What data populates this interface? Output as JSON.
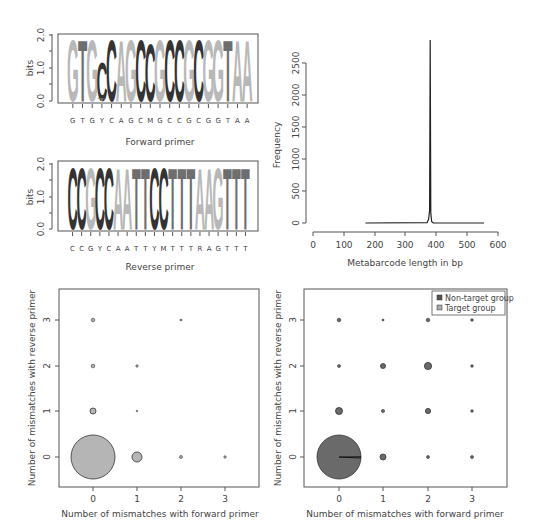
{
  "colors": {
    "logo_C": "#333333",
    "logo_G": "#b8b8b8",
    "logo_A": "#b8b8b8",
    "logo_T": "#6e6e6e",
    "target_fill": "#b5b5b5",
    "nontarget_fill": "#6a6a6a",
    "axis": "#555555"
  },
  "forward_logo": {
    "ylabel": "bits",
    "yticks": [
      "0.0",
      "1.0",
      "2.0"
    ],
    "xlabel": "Forward primer",
    "consensus": [
      "G",
      "T",
      "G",
      "Y",
      "C",
      "A",
      "G",
      "C",
      "M",
      "G",
      "C",
      "C",
      "G",
      "C",
      "G",
      "G",
      "T",
      "A",
      "A"
    ],
    "letters": [
      {
        "l": "G",
        "h": 2.0
      },
      {
        "l": "T",
        "h": 2.0
      },
      {
        "l": "G",
        "h": 2.0
      },
      {
        "l": "C",
        "h": 1.3,
        "sub": "T"
      },
      {
        "l": "C",
        "h": 2.0
      },
      {
        "l": "A",
        "h": 2.0
      },
      {
        "l": "G",
        "h": 2.0
      },
      {
        "l": "C",
        "h": 2.0
      },
      {
        "l": "C",
        "h": 1.9
      },
      {
        "l": "G",
        "h": 2.0
      },
      {
        "l": "C",
        "h": 2.0
      },
      {
        "l": "C",
        "h": 2.0
      },
      {
        "l": "G",
        "h": 2.0
      },
      {
        "l": "C",
        "h": 2.0
      },
      {
        "l": "G",
        "h": 2.0
      },
      {
        "l": "G",
        "h": 2.0
      },
      {
        "l": "T",
        "h": 2.0
      },
      {
        "l": "A",
        "h": 2.0
      },
      {
        "l": "A",
        "h": 2.0
      }
    ]
  },
  "reverse_logo": {
    "ylabel": "bits",
    "yticks": [
      "0.0",
      "1.0",
      "2.0"
    ],
    "xlabel": "Reverse primer",
    "consensus": [
      "C",
      "C",
      "G",
      "Y",
      "C",
      "A",
      "A",
      "T",
      "T",
      "Y",
      "M",
      "T",
      "T",
      "T",
      "R",
      "A",
      "G",
      "T",
      "T",
      "T"
    ],
    "letters": [
      {
        "l": "C",
        "h": 2.0
      },
      {
        "l": "C",
        "h": 2.0
      },
      {
        "l": "G",
        "h": 2.0
      },
      {
        "l": "C",
        "h": 2.0
      },
      {
        "l": "C",
        "h": 2.0
      },
      {
        "l": "A",
        "h": 2.0
      },
      {
        "l": "A",
        "h": 2.0
      },
      {
        "l": "T",
        "h": 2.0
      },
      {
        "l": "T",
        "h": 2.0
      },
      {
        "l": "C",
        "h": 2.0
      },
      {
        "l": "C",
        "h": 2.0
      },
      {
        "l": "T",
        "h": 2.0
      },
      {
        "l": "T",
        "h": 2.0
      },
      {
        "l": "T",
        "h": 2.0
      },
      {
        "l": "A",
        "h": 2.0
      },
      {
        "l": "A",
        "h": 2.0
      },
      {
        "l": "G",
        "h": 2.0
      },
      {
        "l": "T",
        "h": 2.0
      },
      {
        "l": "T",
        "h": 2.0
      },
      {
        "l": "T",
        "h": 2.0
      }
    ]
  },
  "chart_data": [
    {
      "type": "sequence-logo",
      "title": "",
      "xlabel": "Forward primer",
      "ylabel": "bits",
      "ylim": [
        0,
        2
      ],
      "categories": [
        "G",
        "T",
        "G",
        "Y",
        "C",
        "A",
        "G",
        "C",
        "M",
        "G",
        "C",
        "C",
        "G",
        "C",
        "G",
        "G",
        "T",
        "A",
        "A"
      ],
      "values": [
        2.0,
        2.0,
        2.0,
        1.3,
        2.0,
        2.0,
        2.0,
        2.0,
        1.9,
        2.0,
        2.0,
        2.0,
        2.0,
        2.0,
        2.0,
        2.0,
        2.0,
        2.0,
        2.0
      ]
    },
    {
      "type": "sequence-logo",
      "title": "",
      "xlabel": "Reverse primer",
      "ylabel": "bits",
      "ylim": [
        0,
        2
      ],
      "categories": [
        "C",
        "C",
        "G",
        "Y",
        "C",
        "A",
        "A",
        "T",
        "T",
        "Y",
        "M",
        "T",
        "T",
        "T",
        "R",
        "A",
        "G",
        "T",
        "T",
        "T"
      ],
      "values": [
        2.0,
        2.0,
        2.0,
        2.0,
        2.0,
        2.0,
        2.0,
        2.0,
        2.0,
        2.0,
        2.0,
        2.0,
        2.0,
        2.0,
        2.0,
        2.0,
        2.0,
        2.0,
        2.0,
        2.0
      ]
    },
    {
      "type": "line",
      "title": "",
      "xlabel": "Metabarcode length in bp",
      "ylabel": "Frequency",
      "xlim": [
        0,
        600
      ],
      "ylim": [
        0,
        2900
      ],
      "xticks": [
        0,
        100,
        200,
        300,
        400,
        500,
        600
      ],
      "yticks": [
        0,
        500,
        1000,
        1500,
        2000,
        2500
      ],
      "x": [
        170,
        370,
        375,
        378,
        380,
        382,
        385,
        390,
        555
      ],
      "y": [
        0,
        5,
        60,
        200,
        2860,
        150,
        20,
        3,
        0
      ]
    },
    {
      "type": "scatter",
      "subtype": "bubble",
      "title": "",
      "xlabel": "Number of mismatches with forward primer",
      "ylabel": "Number of mismatches with reverse primer",
      "xticks": [
        0,
        1,
        2,
        3
      ],
      "yticks": [
        0,
        1,
        2,
        3
      ],
      "series": [
        {
          "name": "Target group",
          "points": [
            {
              "x": 0,
              "y": 0,
              "r": 22
            },
            {
              "x": 1,
              "y": 0,
              "r": 5
            },
            {
              "x": 2,
              "y": 0,
              "r": 1.5
            },
            {
              "x": 3,
              "y": 0,
              "r": 1.2
            },
            {
              "x": 0,
              "y": 1,
              "r": 3
            },
            {
              "x": 1,
              "y": 1,
              "r": 0.8
            },
            {
              "x": 0,
              "y": 2,
              "r": 1.8
            },
            {
              "x": 1,
              "y": 2,
              "r": 1.2
            },
            {
              "x": 0,
              "y": 3,
              "r": 1.8
            },
            {
              "x": 2,
              "y": 3,
              "r": 1
            }
          ]
        }
      ]
    },
    {
      "type": "scatter",
      "subtype": "bubble-pie",
      "title": "",
      "xlabel": "Number of mismatches with forward primer",
      "ylabel": "Number of mismatches with reverse primer",
      "xticks": [
        0,
        1,
        2,
        3
      ],
      "yticks": [
        0,
        1,
        2,
        3
      ],
      "legend": [
        "Non-target group",
        "Target group"
      ],
      "legend_position": "top-right",
      "series": [
        {
          "name": "Non-target group",
          "points": [
            {
              "x": 0,
              "y": 0,
              "r": 22
            },
            {
              "x": 1,
              "y": 0,
              "r": 3
            },
            {
              "x": 2,
              "y": 0,
              "r": 1.5
            },
            {
              "x": 3,
              "y": 0,
              "r": 1.5
            },
            {
              "x": 0,
              "y": 1,
              "r": 3.5
            },
            {
              "x": 1,
              "y": 1,
              "r": 1.6
            },
            {
              "x": 2,
              "y": 1,
              "r": 2.6
            },
            {
              "x": 3,
              "y": 1,
              "r": 1.3
            },
            {
              "x": 0,
              "y": 2,
              "r": 1.5
            },
            {
              "x": 1,
              "y": 2,
              "r": 2.5
            },
            {
              "x": 2,
              "y": 2,
              "r": 3.6
            },
            {
              "x": 3,
              "y": 2,
              "r": 1.3
            },
            {
              "x": 0,
              "y": 3,
              "r": 1.8
            },
            {
              "x": 1,
              "y": 3,
              "r": 1
            },
            {
              "x": 2,
              "y": 3,
              "r": 1.8
            },
            {
              "x": 3,
              "y": 3,
              "r": 1.3
            }
          ]
        }
      ]
    }
  ],
  "histogram": {
    "ylabel": "Frequency",
    "xlabel": "Metabarcode length in bp",
    "xticks": [
      "0",
      "100",
      "200",
      "300",
      "400",
      "500",
      "600"
    ],
    "yticks": [
      "0",
      "500",
      "1000",
      "1500",
      "2000",
      "2500"
    ]
  },
  "bubble_left": {
    "xlabel": "Number of mismatches with forward primer",
    "ylabel": "Number of mismatches with reverse primer",
    "xticks": [
      "0",
      "1",
      "2",
      "3"
    ],
    "yticks": [
      "0",
      "1",
      "2",
      "3"
    ]
  },
  "bubble_right": {
    "xlabel": "Number of mismatches with forward primer",
    "ylabel": "Number of mismatches with reverse primer",
    "xticks": [
      "0",
      "1",
      "2",
      "3"
    ],
    "yticks": [
      "0",
      "1",
      "2",
      "3"
    ],
    "legend": {
      "nontarget": "Non-target group",
      "target": "Target group"
    }
  }
}
